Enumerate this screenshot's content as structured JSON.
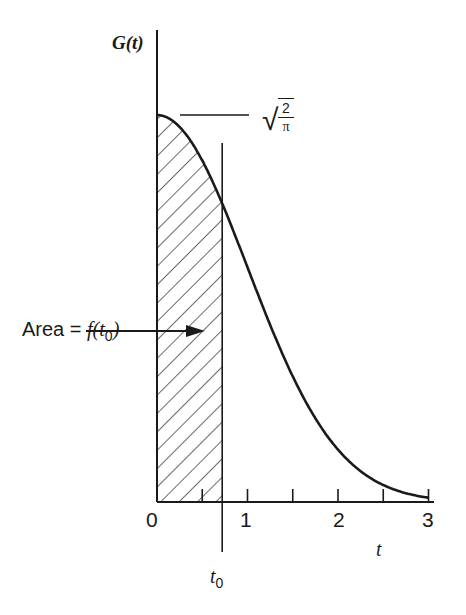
{
  "chart_data": {
    "type": "area",
    "title": "",
    "function": "G(t) = sqrt(2/pi) * exp(-t^2/2)",
    "xlabel": "t",
    "ylabel": "G(t)",
    "xlim": [
      0,
      3.05
    ],
    "ylim": [
      0,
      0.95
    ],
    "grid": false,
    "legend": null,
    "x_ticks": [
      0,
      0.5,
      1,
      1.5,
      2,
      2.5,
      3
    ],
    "x_tick_labels": [
      "0",
      "1",
      "2",
      "3"
    ],
    "x_tick_label_positions": [
      0,
      1,
      2,
      3
    ],
    "x": [
      0,
      0.25,
      0.5,
      0.72,
      1.0,
      1.25,
      1.5,
      1.75,
      2.0,
      2.25,
      2.5,
      2.75,
      3.0
    ],
    "values": [
      0.798,
      0.773,
      0.704,
      0.617,
      0.484,
      0.366,
      0.259,
      0.173,
      0.108,
      0.064,
      0.035,
      0.018,
      0.009
    ],
    "peak_value_label": "√(2/π)",
    "peak_value": 0.798,
    "t0": 0.72,
    "t0_label": "t0",
    "shaded_region": {
      "from": 0,
      "to": 0.72,
      "pattern": "diagonal-hatch"
    },
    "annotations": [
      {
        "text": "Area = f(t0)",
        "points_to": "shaded_region"
      },
      {
        "text": "√(2/π)",
        "marks": "y-intercept"
      }
    ]
  },
  "labels": {
    "y_axis": "G(t)",
    "x_axis": "t",
    "t0_main": "t",
    "t0_sub": "0",
    "area_prefix": "Area = ",
    "area_func": "f(t",
    "area_sub": "0",
    "area_close": ")",
    "sqrt_sign": "√",
    "sqrt_num": "2",
    "sqrt_den": "π",
    "tick0": "0",
    "tick1": "1",
    "tick2": "2",
    "tick3": "3"
  },
  "colors": {
    "ink": "#1a1a1a",
    "background": "#ffffff"
  }
}
